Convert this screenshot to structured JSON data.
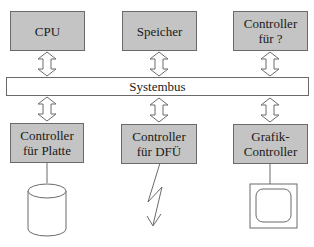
{
  "diagram": {
    "top_components": [
      {
        "line1": "CPU",
        "line2": ""
      },
      {
        "line1": "Speicher",
        "line2": ""
      },
      {
        "line1": "Controller",
        "line2": "für ?"
      }
    ],
    "bus": {
      "label": "Systembus"
    },
    "bottom_components": [
      {
        "line1": "Controller",
        "line2": "für Platte",
        "device": "disk-cylinder"
      },
      {
        "line1": "Controller",
        "line2": "für DFÜ",
        "device": "lightning-link"
      },
      {
        "line1": "Grafik-",
        "line2": "Controller",
        "device": "monitor"
      }
    ],
    "colors": {
      "box_fill": "#c4c4c4",
      "stroke": "#6a6a6a",
      "background": "#ffffff"
    }
  }
}
